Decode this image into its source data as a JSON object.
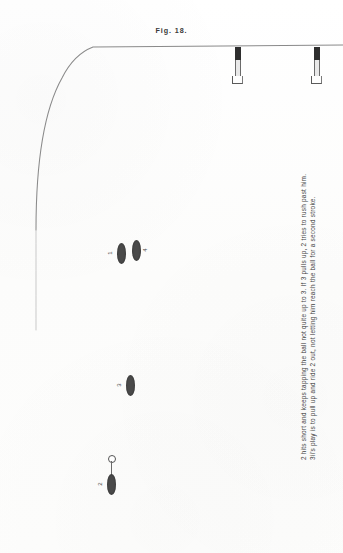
{
  "figure": {
    "title": "Fig. 18.",
    "caption_lines": [
      "2 hits short and keeps tapping the ball not quite up to 3.  If 3 pulls up, 2 tries to rush past him.",
      "3ii's play is to pull up and ride 2 out, not letting him reach the ball for a second stroke."
    ]
  },
  "field": {
    "boundary_label": "field-boundary-line",
    "line_color": "#7a7a7a"
  },
  "goal_posts": [
    {
      "name": "goal-post-left",
      "x": 232,
      "y": 47
    },
    {
      "name": "goal-post-right",
      "x": 311,
      "y": 47
    }
  ],
  "players": [
    {
      "label": "1",
      "x": 117,
      "y": 243,
      "label_side": "left"
    },
    {
      "label": "4",
      "x": 132,
      "y": 240,
      "label_side": "right"
    },
    {
      "label": "3",
      "x": 126,
      "y": 375,
      "label_side": "left"
    },
    {
      "label": "2",
      "x": 107,
      "y": 477,
      "label_side": "left"
    }
  ],
  "ball": {
    "name": "ball",
    "x": 108,
    "y": 455
  }
}
